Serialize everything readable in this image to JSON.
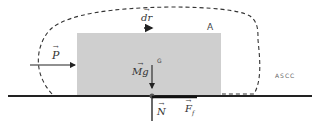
{
  "diagram": {
    "type": "free-body diagram",
    "colors": {
      "block_fill": "#cfcfcf",
      "line": "#222222",
      "dashed_boundary": "#333333",
      "text": "#333333"
    },
    "block": {
      "label": "A",
      "center_label": "G"
    },
    "labels": {
      "push_force": "P",
      "displacement": "dr",
      "weight": "Mg",
      "normal": "N",
      "friction": "F",
      "friction_sub": "f",
      "boundary_tag": "ASCC"
    }
  }
}
